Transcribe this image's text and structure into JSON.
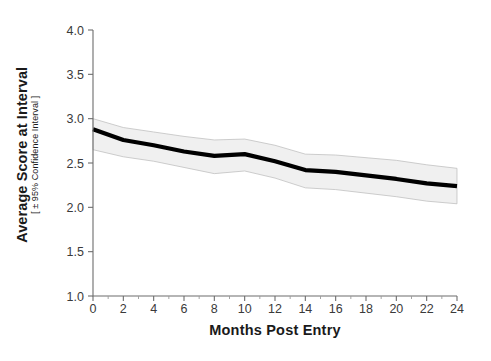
{
  "chart_data": {
    "type": "line",
    "title": "",
    "subtitle": "",
    "xlabel": "Months Post Entry",
    "ylabel": "Average Score at Interval",
    "ylabel_sub": "[ ± 95% Confidence Interval ]",
    "xlim": [
      0,
      24
    ],
    "ylim": [
      1.0,
      4.0
    ],
    "grid": false,
    "legend": null,
    "legend_position": "none",
    "xticks": [
      0,
      2,
      4,
      6,
      8,
      10,
      12,
      14,
      16,
      18,
      20,
      22,
      24
    ],
    "xtick_labels": [
      "0",
      "2",
      "4",
      "6",
      "8",
      "10",
      "12",
      "14",
      "16",
      "18",
      "20",
      "22",
      "24"
    ],
    "xticks_minor": [
      1,
      3,
      5,
      7,
      9,
      11,
      13,
      15,
      17,
      19,
      21,
      23
    ],
    "yticks": [
      1.0,
      1.5,
      2.0,
      2.5,
      3.0,
      3.5,
      4.0
    ],
    "ytick_labels": [
      "1.0",
      "1.5",
      "2.0",
      "2.5",
      "3.0",
      "3.5",
      "4.0"
    ],
    "x": [
      0,
      2,
      4,
      6,
      8,
      10,
      12,
      14,
      16,
      18,
      20,
      22,
      24
    ],
    "series": [
      {
        "name": "Average Score",
        "style": "solid-black-thick",
        "color": "#000000",
        "values": [
          2.88,
          2.76,
          2.7,
          2.63,
          2.58,
          2.6,
          2.52,
          2.42,
          2.4,
          2.36,
          2.32,
          2.27,
          2.24
        ]
      }
    ],
    "confidence_band": {
      "label": "95% Confidence Interval",
      "fill_color": "#f0f0f0",
      "edge_color": "#b9b9b9",
      "upper": [
        3.0,
        2.9,
        2.85,
        2.8,
        2.76,
        2.77,
        2.7,
        2.6,
        2.59,
        2.56,
        2.53,
        2.48,
        2.44
      ],
      "lower": [
        2.65,
        2.57,
        2.52,
        2.45,
        2.38,
        2.41,
        2.33,
        2.22,
        2.2,
        2.16,
        2.12,
        2.07,
        2.04
      ]
    }
  },
  "figure": {
    "background_color": "#ffffff",
    "axis_color": "#6d6d6d",
    "text_color": "#1a1a1a"
  }
}
